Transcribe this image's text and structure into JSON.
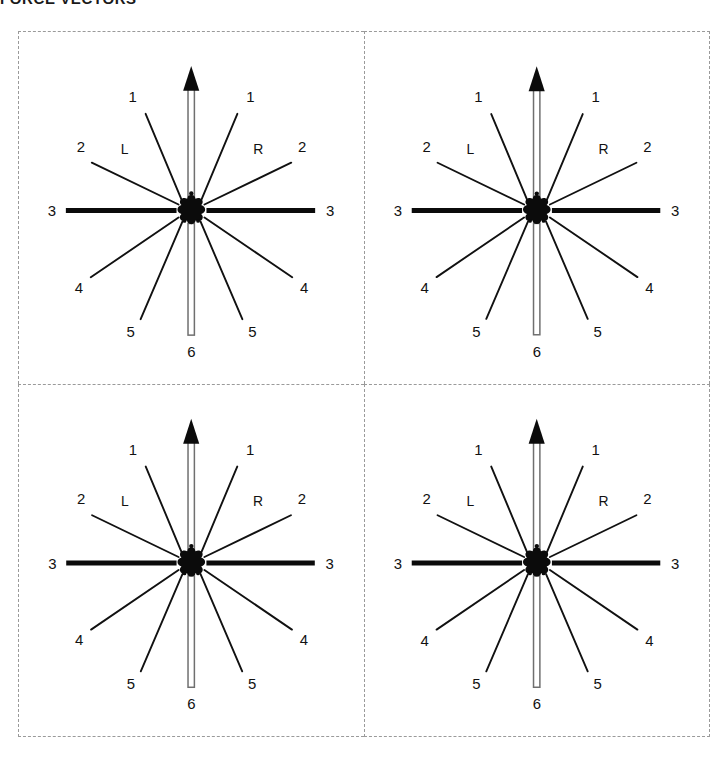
{
  "page": {
    "title": "FORCE VECTORS"
  },
  "figure": {
    "name": "force-vector-rosette-grid",
    "rows": 2,
    "columns": 2,
    "border_style": "dashed",
    "border_color": "#9a9a9a",
    "background": "#ffffff"
  },
  "rosette": {
    "center_marker": "star-blob",
    "side_labels": {
      "left": "L",
      "right": "R"
    },
    "up_vector": {
      "label": "",
      "style": "double-line-with-arrowhead",
      "direction": "up"
    },
    "down_vector": {
      "label": "6",
      "style": "double-line-no-arrowhead",
      "direction": "down"
    },
    "horizontal_vector": {
      "label": "3",
      "style": "thick-solid-bar"
    },
    "spokes": [
      {
        "id": "L1",
        "side": "left",
        "label": "1",
        "angle_deg": 113,
        "weight": "thin"
      },
      {
        "id": "L2",
        "side": "left",
        "label": "2",
        "angle_deg": 148,
        "weight": "thin"
      },
      {
        "id": "L3",
        "side": "left",
        "label": "3",
        "angle_deg": 180,
        "weight": "thick"
      },
      {
        "id": "L4",
        "side": "left",
        "label": "4",
        "angle_deg": 212,
        "weight": "thin"
      },
      {
        "id": "L5",
        "side": "left",
        "label": "5",
        "angle_deg": 247,
        "weight": "thin"
      },
      {
        "id": "U6",
        "side": "up",
        "label": "",
        "angle_deg": 90,
        "weight": "double"
      },
      {
        "id": "R1",
        "side": "right",
        "label": "1",
        "angle_deg": 67,
        "weight": "thin"
      },
      {
        "id": "R2",
        "side": "right",
        "label": "2",
        "angle_deg": 32,
        "weight": "thin"
      },
      {
        "id": "R3",
        "side": "right",
        "label": "3",
        "angle_deg": 0,
        "weight": "thick"
      },
      {
        "id": "R4",
        "side": "right",
        "label": "4",
        "angle_deg": -32,
        "weight": "thin"
      },
      {
        "id": "R5",
        "side": "right",
        "label": "5",
        "angle_deg": -67,
        "weight": "thin"
      },
      {
        "id": "D6",
        "side": "down",
        "label": "6",
        "angle_deg": -90,
        "weight": "double"
      }
    ],
    "labels": {
      "l1": "1",
      "l2": "2",
      "l3": "3",
      "l4": "4",
      "l5": "5",
      "r1": "1",
      "r2": "2",
      "r3": "3",
      "r4": "4",
      "r5": "5",
      "d6": "6",
      "left_side": "L",
      "right_side": "R"
    }
  },
  "panels": [
    {
      "id": "panel-top-left",
      "position": "top-left"
    },
    {
      "id": "panel-top-right",
      "position": "top-right"
    },
    {
      "id": "panel-bottom-left",
      "position": "bottom-left"
    },
    {
      "id": "panel-bottom-right",
      "position": "bottom-right"
    }
  ]
}
